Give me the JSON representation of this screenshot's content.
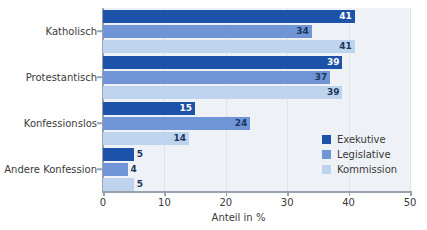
{
  "chart_data": {
    "type": "bar",
    "orientation": "horizontal",
    "title": "",
    "xlabel": "Anteil in %",
    "ylabel": "",
    "xlim": [
      0,
      50
    ],
    "xticks": [
      0,
      10,
      20,
      30,
      40,
      50
    ],
    "xtick_labels": [
      "0",
      "10",
      "20",
      "30",
      "40",
      "50"
    ],
    "grid": true,
    "grid_axis": "x",
    "legend_position": "bottom-right",
    "categories": [
      "Katholisch",
      "Protestantisch",
      "Konfessionslos",
      "Andere Konfession"
    ],
    "series": [
      {
        "name": "Exekutive",
        "color": "#1c52a8",
        "values": [
          41,
          39,
          15,
          5
        ]
      },
      {
        "name": "Legislative",
        "color": "#6f95d6",
        "values": [
          34,
          37,
          24,
          4
        ]
      },
      {
        "name": "Kommission",
        "color": "#bed3ee",
        "values": [
          41,
          39,
          14,
          5
        ]
      }
    ]
  },
  "colors": {
    "plot_background": "#eef1f5",
    "gridline": "#dfe4ea",
    "axis": "#9aa3ad",
    "value_label": "#1b365d",
    "text": "#3a3a3a"
  }
}
